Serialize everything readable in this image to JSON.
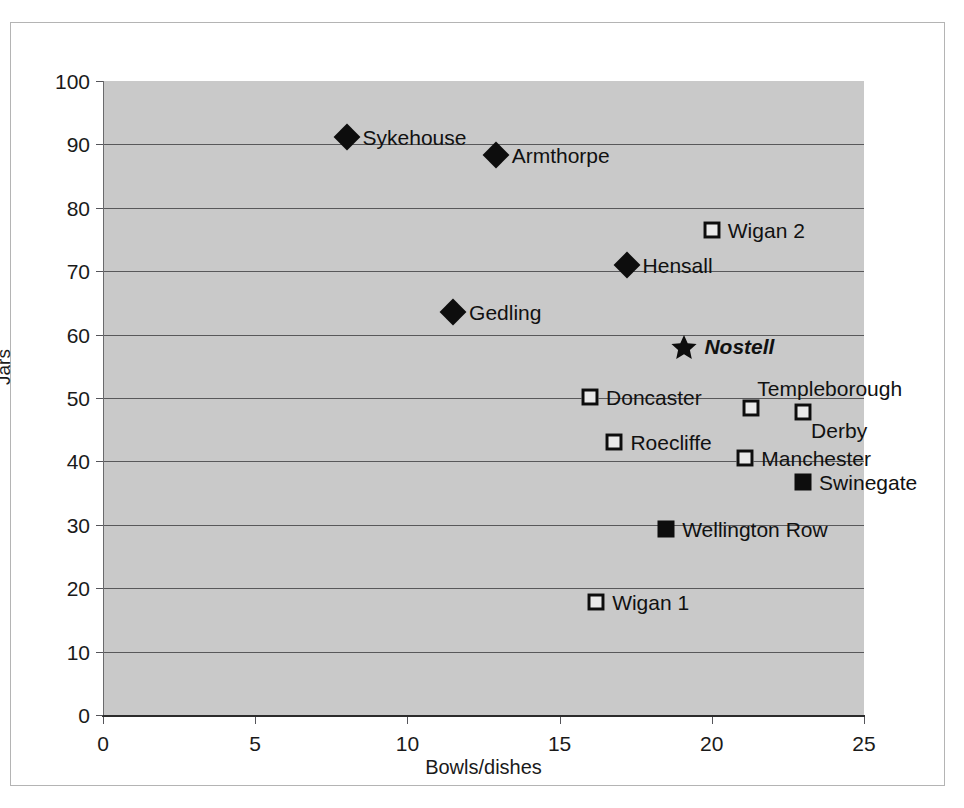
{
  "chart_data": {
    "type": "scatter",
    "title": "",
    "xlabel": "Bowls/dishes",
    "ylabel": "Jars",
    "xlim": [
      0,
      25
    ],
    "ylim": [
      0,
      100
    ],
    "xticks": [
      "0",
      "5",
      "10",
      "15",
      "20",
      "25"
    ],
    "yticks": [
      "0",
      "10",
      "20",
      "30",
      "40",
      "50",
      "60",
      "70",
      "80",
      "90",
      "100"
    ],
    "grid": "horizontal",
    "legend": "none",
    "plot_background": "#c9c9c9",
    "marker_color": "#0d0d0d",
    "points": [
      {
        "label": "Sykehouse",
        "x": 8.0,
        "y": 91.2,
        "marker": "filled-diamond",
        "label_pos": "right",
        "emphasis": false
      },
      {
        "label": "Armthorpe",
        "x": 12.9,
        "y": 88.3,
        "marker": "filled-diamond",
        "label_pos": "right",
        "emphasis": false
      },
      {
        "label": "Wigan 2",
        "x": 20.0,
        "y": 76.5,
        "marker": "open-square",
        "label_pos": "right",
        "emphasis": false
      },
      {
        "label": "Hensall",
        "x": 17.2,
        "y": 71.0,
        "marker": "filled-diamond",
        "label_pos": "right",
        "emphasis": false
      },
      {
        "label": "Gedling",
        "x": 11.5,
        "y": 63.5,
        "marker": "filled-diamond",
        "label_pos": "right",
        "emphasis": false
      },
      {
        "label": "Nostell",
        "x": 19.1,
        "y": 58.0,
        "marker": "star",
        "label_pos": "right",
        "emphasis": true
      },
      {
        "label": "Doncaster",
        "x": 16.0,
        "y": 50.2,
        "marker": "open-square",
        "label_pos": "right",
        "emphasis": false
      },
      {
        "label": "Templeborough",
        "x": 21.3,
        "y": 48.5,
        "marker": "open-square",
        "label_pos": "above-right",
        "emphasis": false
      },
      {
        "label": "Derby",
        "x": 23.0,
        "y": 47.8,
        "marker": "open-square",
        "label_pos": "below-right",
        "emphasis": false
      },
      {
        "label": "Roecliffe",
        "x": 16.8,
        "y": 43.0,
        "marker": "open-square",
        "label_pos": "right",
        "emphasis": false
      },
      {
        "label": "Manchester",
        "x": 21.1,
        "y": 40.5,
        "marker": "open-square",
        "label_pos": "right",
        "emphasis": false
      },
      {
        "label": "Swinegate",
        "x": 23.0,
        "y": 36.7,
        "marker": "filled-square",
        "label_pos": "right",
        "emphasis": false
      },
      {
        "label": "Wellington Row",
        "x": 18.5,
        "y": 29.3,
        "marker": "filled-square",
        "label_pos": "right",
        "emphasis": false
      },
      {
        "label": "Wigan 1",
        "x": 16.2,
        "y": 17.8,
        "marker": "open-square",
        "label_pos": "right",
        "emphasis": false
      }
    ]
  }
}
